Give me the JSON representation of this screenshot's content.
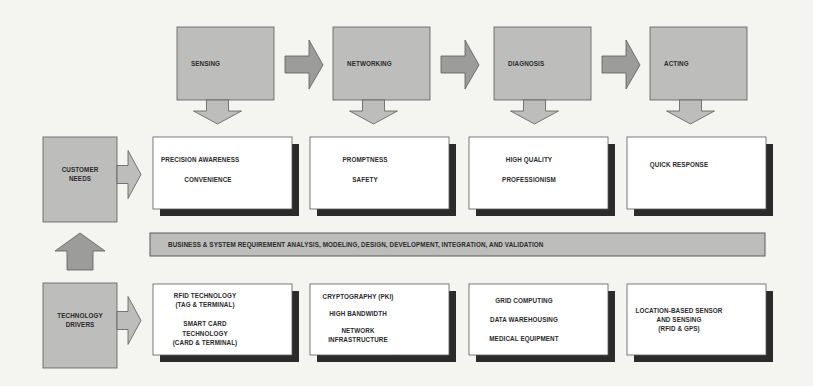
{
  "colors": {
    "background": "#f4f4f1",
    "stage_fill": "#bdbdbb",
    "arrow_fill": "#9c9c9a",
    "box_fill": "#ffffff",
    "shadow": "#2b2b2b",
    "outline": "#5a5a5a",
    "text": "#2a2a2a"
  },
  "stages": [
    {
      "label": "SENSING"
    },
    {
      "label": "NETWORKING"
    },
    {
      "label": "DIAGNOSIS"
    },
    {
      "label": "ACTING"
    }
  ],
  "customer_needs": {
    "label_lines": [
      "CUSTOMER",
      "NEEDS"
    ],
    "boxes": [
      {
        "lines": [
          "PRECISION AWARENESS",
          "CONVENIENCE"
        ]
      },
      {
        "lines": [
          "PROMPTNESS",
          "SAFETY"
        ]
      },
      {
        "lines": [
          "HIGH QUALITY",
          "PROFESSIONISM"
        ]
      },
      {
        "lines": [
          "QUICK RESPONSE"
        ]
      }
    ]
  },
  "requirement_bar": {
    "label": "BUSINESS & SYSTEM REQUIREMENT ANALYSIS, MODELING, DESIGN, DEVELOPMENT, INTEGRATION, AND VALIDATION"
  },
  "technology_drivers": {
    "label_lines": [
      "TECHNOLOGY",
      "DRIVERS"
    ],
    "boxes": [
      {
        "lines": [
          "RFID TECHNOLOGY",
          "(TAG & TERMINAL)",
          "",
          "SMART CARD",
          "TECHNOLOGY",
          "(CARD & TERMINAL)"
        ]
      },
      {
        "lines": [
          "CRYPTOGRAPHY (PKI)",
          "",
          "HIGH BANDWIDTH",
          "",
          "NETWORK",
          "INFRASTRUCTURE"
        ]
      },
      {
        "lines": [
          "GRID COMPUTING",
          "",
          "DATA WAREHOUSING",
          "",
          "MEDICAL EQUIPMENT"
        ]
      },
      {
        "lines": [
          "LOCATION-BASED SENSOR",
          "AND SENSING",
          "(RFID & GPS)"
        ]
      }
    ]
  }
}
